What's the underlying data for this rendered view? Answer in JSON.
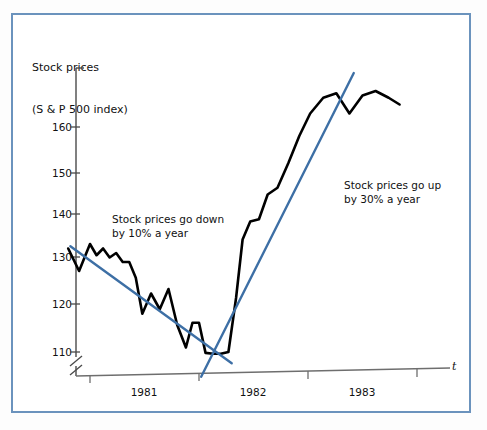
{
  "figure": {
    "border_color": "#6b93bd",
    "background": "#ffffff"
  },
  "axis_title": {
    "line1": "Stock prices",
    "line2": "(S & P 500 index)"
  },
  "x_axis_symbol": "t",
  "annotations": {
    "down": {
      "line1": "Stock prices go down",
      "line2": "by 10% a year"
    },
    "up": {
      "line1": "Stock prices go up",
      "line2": "by 30% a year"
    }
  },
  "y_ticks": [
    {
      "label": "160",
      "value": 160
    },
    {
      "label": "150",
      "value": 150
    },
    {
      "label": "140",
      "value": 140
    },
    {
      "label": "130",
      "value": 130
    },
    {
      "label": "120",
      "value": 120
    },
    {
      "label": "110",
      "value": 110
    }
  ],
  "x_ticks": [
    {
      "label": "1981"
    },
    {
      "label": "1982"
    },
    {
      "label": "1983"
    }
  ],
  "chart_data": {
    "type": "line",
    "title": "Stock prices (S & P 500 index)",
    "xlabel": "t",
    "ylabel": "Stock prices (S & P 500 index)",
    "ylim": [
      108,
      172
    ],
    "xlim": [
      1980.75,
      1983.85
    ],
    "grid": false,
    "legend": "none",
    "y_axis_break": true,
    "y_axis_break_note": "double-slash break below 110",
    "y_tick_values": [
      110,
      120,
      130,
      140,
      150,
      160
    ],
    "x_tick_values": [
      1981.0,
      1982.0,
      1983.0,
      1983.85
    ],
    "x_tick_labels": [
      "1981",
      "1982",
      "1983"
    ],
    "series": [
      {
        "name": "S & P 500 index",
        "color": "#000000",
        "style": "solid",
        "width": 2.6,
        "x": [
          1980.8,
          1980.9,
          1981.0,
          1981.06,
          1981.12,
          1981.18,
          1981.24,
          1981.3,
          1981.36,
          1981.42,
          1981.48,
          1981.56,
          1981.64,
          1981.72,
          1981.8,
          1981.88,
          1981.94,
          1982.0,
          1982.06,
          1982.13,
          1982.2,
          1982.27,
          1982.34,
          1982.4,
          1982.47,
          1982.55,
          1982.63,
          1982.72,
          1982.82,
          1982.92,
          1983.02,
          1983.14,
          1983.26,
          1983.38,
          1983.5,
          1983.62,
          1983.74,
          1983.84
        ],
        "y": [
          133.0,
          128.0,
          134.0,
          131.5,
          133.0,
          131.0,
          132.0,
          130.0,
          130.0,
          126.5,
          118.5,
          123.0,
          119.5,
          124.0,
          116.0,
          111.0,
          116.5,
          116.5,
          109.8,
          109.6,
          109.6,
          110.0,
          122.0,
          135.0,
          139.0,
          139.5,
          145.0,
          146.5,
          152.0,
          158.0,
          163.0,
          166.5,
          167.5,
          163.0,
          167.0,
          168.0,
          166.5,
          165.0
        ]
      }
    ],
    "trend_lines": [
      {
        "name": "downtrend",
        "label": "Stock prices go down by 10% a year",
        "color": "#3d6fa5",
        "rate_percent_per_year": -10,
        "direction": "down",
        "x_start": 1980.82,
        "y_start": 133.5,
        "x_end": 1982.3,
        "y_end": 107.5
      },
      {
        "name": "uptrend",
        "label": "Stock prices go up by 30% a year",
        "color": "#3d6fa5",
        "rate_percent_per_year": 30,
        "direction": "up",
        "x_start": 1982.02,
        "y_start": 104.5,
        "x_end": 1983.42,
        "y_end": 172.0
      }
    ]
  }
}
